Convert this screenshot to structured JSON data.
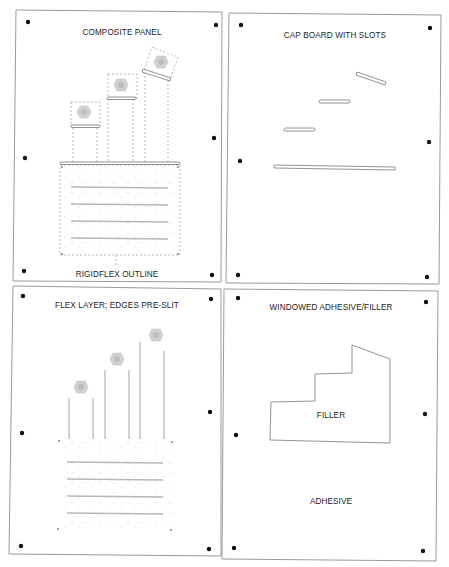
{
  "panels": [
    {
      "id": "composite",
      "title": "COMPOSITE PANEL",
      "caption": "RIGIDFLEX OUTLINE"
    },
    {
      "id": "cap",
      "title": "CAP BOARD WITH SLOTS"
    },
    {
      "id": "flex",
      "title": "FLEX LAYER; EDGES PRE-SLIT"
    },
    {
      "id": "adhesive",
      "title": "WINDOWED ADHESIVE/FILLER",
      "filler_label": "FILLER",
      "adhesive_label": "ADHESIVE"
    }
  ],
  "colors": {
    "border": "#9a9a9a",
    "ink": "#1c1c1c",
    "line": "#8a8a8a",
    "dashed": "#9c9c9c",
    "component": "#c8c8c8",
    "dot": "#111111"
  }
}
